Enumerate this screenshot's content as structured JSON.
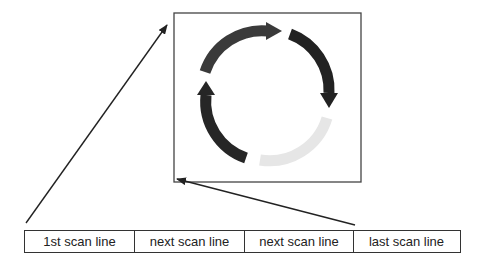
{
  "diagram": {
    "image_frame": {
      "label": "image-frame"
    },
    "arrows": [
      {
        "from": "1st scan line",
        "to": "top-left of image frame"
      },
      {
        "from": "last scan line",
        "to": "bottom-left of image frame"
      }
    ],
    "circular_arrows": {
      "segments": [
        {
          "position": "top",
          "color": "#3a3a3a"
        },
        {
          "position": "right",
          "color": "#222222"
        },
        {
          "position": "bottom",
          "color": "#e6e6e6"
        },
        {
          "position": "left",
          "color": "#262626"
        }
      ]
    }
  },
  "scan_lines": [
    {
      "label": "1st scan line"
    },
    {
      "label": "next scan line"
    },
    {
      "label": "next scan line"
    },
    {
      "label": "last scan line"
    }
  ]
}
